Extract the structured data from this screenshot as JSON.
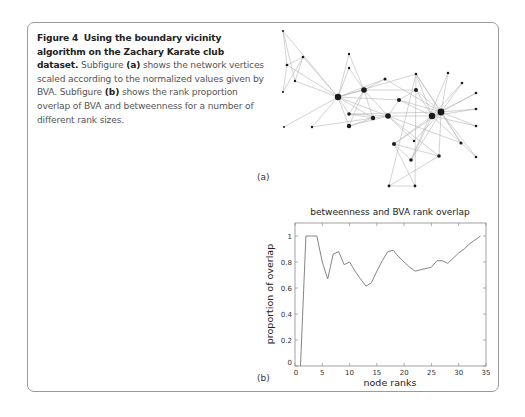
{
  "caption": {
    "figure_label": "Figure 4",
    "title": "Using the boundary vicinity algorithm on the Zachary Karate club dataset.",
    "text_1": "Subfigure",
    "ref_a": "(a)",
    "text_2": "shows the network vertices scaled according to the normalized values given by BVA. Subfigure",
    "ref_b": "(b)",
    "text_3": "shows the rank proportion overlap of BVA and betweenness for a number of different rank sizes."
  },
  "subfigure_a": {
    "label": "(a)",
    "network": {
      "nodes": [
        {
          "id": 0,
          "x": 338,
          "y": 97,
          "r": 3.2
        },
        {
          "id": 1,
          "x": 364,
          "y": 90,
          "r": 2.8
        },
        {
          "id": 2,
          "x": 388,
          "y": 116,
          "r": 2.8
        },
        {
          "id": 3,
          "x": 373,
          "y": 118,
          "r": 2.2
        },
        {
          "id": 4,
          "x": 283,
          "y": 31,
          "r": 1.1
        },
        {
          "id": 5,
          "x": 303,
          "y": 57,
          "r": 1.3
        },
        {
          "id": 6,
          "x": 287,
          "y": 65,
          "r": 1.3
        },
        {
          "id": 7,
          "x": 349,
          "y": 126,
          "r": 2.2
        },
        {
          "id": 8,
          "x": 399,
          "y": 100,
          "r": 2.0
        },
        {
          "id": 9,
          "x": 414,
          "y": 141,
          "r": 1.2
        },
        {
          "id": 10,
          "x": 295,
          "y": 81,
          "r": 1.2
        },
        {
          "id": 11,
          "x": 284,
          "y": 127,
          "r": 1.0
        },
        {
          "id": 12,
          "x": 312,
          "y": 127,
          "r": 1.2
        },
        {
          "id": 13,
          "x": 349,
          "y": 114,
          "r": 1.8
        },
        {
          "id": 14,
          "x": 476,
          "y": 126,
          "r": 1.3
        },
        {
          "id": 15,
          "x": 476,
          "y": 109,
          "r": 1.3
        },
        {
          "id": 16,
          "x": 283,
          "y": 92,
          "r": 1.1
        },
        {
          "id": 17,
          "x": 349,
          "y": 68,
          "r": 1.2
        },
        {
          "id": 18,
          "x": 476,
          "y": 93,
          "r": 1.3
        },
        {
          "id": 19,
          "x": 385,
          "y": 79,
          "r": 1.5
        },
        {
          "id": 20,
          "x": 476,
          "y": 157,
          "r": 1.3
        },
        {
          "id": 21,
          "x": 349,
          "y": 54,
          "r": 1.2
        },
        {
          "id": 22,
          "x": 462,
          "y": 83,
          "r": 1.3
        },
        {
          "id": 23,
          "x": 394,
          "y": 144,
          "r": 2.0
        },
        {
          "id": 24,
          "x": 389,
          "y": 186,
          "r": 1.4
        },
        {
          "id": 25,
          "x": 415,
          "y": 186,
          "r": 1.4
        },
        {
          "id": 26,
          "x": 448,
          "y": 73,
          "r": 1.3
        },
        {
          "id": 27,
          "x": 439,
          "y": 156,
          "r": 1.8
        },
        {
          "id": 28,
          "x": 461,
          "y": 143,
          "r": 1.6
        },
        {
          "id": 29,
          "x": 411,
          "y": 160,
          "r": 1.8
        },
        {
          "id": 30,
          "x": 416,
          "y": 90,
          "r": 2.0
        },
        {
          "id": 31,
          "x": 416,
          "y": 74,
          "r": 1.3
        },
        {
          "id": 32,
          "x": 432,
          "y": 116,
          "r": 3.2
        },
        {
          "id": 33,
          "x": 441,
          "y": 112,
          "r": 3.4
        }
      ],
      "edges": [
        [
          0,
          1
        ],
        [
          0,
          2
        ],
        [
          0,
          3
        ],
        [
          0,
          4
        ],
        [
          0,
          5
        ],
        [
          0,
          6
        ],
        [
          0,
          7
        ],
        [
          0,
          8
        ],
        [
          0,
          10
        ],
        [
          0,
          11
        ],
        [
          0,
          12
        ],
        [
          0,
          13
        ],
        [
          0,
          17
        ],
        [
          0,
          19
        ],
        [
          0,
          21
        ],
        [
          0,
          31
        ],
        [
          1,
          2
        ],
        [
          1,
          3
        ],
        [
          1,
          7
        ],
        [
          1,
          13
        ],
        [
          1,
          17
        ],
        [
          1,
          19
        ],
        [
          1,
          21
        ],
        [
          1,
          30
        ],
        [
          2,
          3
        ],
        [
          2,
          7
        ],
        [
          2,
          8
        ],
        [
          2,
          9
        ],
        [
          2,
          13
        ],
        [
          2,
          27
        ],
        [
          2,
          28
        ],
        [
          2,
          32
        ],
        [
          3,
          7
        ],
        [
          3,
          12
        ],
        [
          3,
          13
        ],
        [
          4,
          6
        ],
        [
          4,
          10
        ],
        [
          5,
          6
        ],
        [
          5,
          10
        ],
        [
          5,
          16
        ],
        [
          6,
          16
        ],
        [
          8,
          30
        ],
        [
          8,
          32
        ],
        [
          8,
          33
        ],
        [
          9,
          33
        ],
        [
          13,
          33
        ],
        [
          14,
          32
        ],
        [
          14,
          33
        ],
        [
          15,
          32
        ],
        [
          15,
          33
        ],
        [
          18,
          32
        ],
        [
          18,
          33
        ],
        [
          19,
          33
        ],
        [
          20,
          32
        ],
        [
          20,
          33
        ],
        [
          22,
          32
        ],
        [
          22,
          33
        ],
        [
          23,
          25
        ],
        [
          23,
          27
        ],
        [
          23,
          29
        ],
        [
          23,
          32
        ],
        [
          23,
          33
        ],
        [
          24,
          25
        ],
        [
          24,
          27
        ],
        [
          24,
          31
        ],
        [
          25,
          31
        ],
        [
          26,
          29
        ],
        [
          26,
          33
        ],
        [
          27,
          33
        ],
        [
          28,
          31
        ],
        [
          28,
          33
        ],
        [
          29,
          32
        ],
        [
          29,
          33
        ],
        [
          30,
          32
        ],
        [
          30,
          33
        ],
        [
          31,
          32
        ],
        [
          31,
          33
        ],
        [
          32,
          33
        ]
      ]
    }
  },
  "subfigure_b": {
    "label": "(b)"
  },
  "chart_data": {
    "type": "line",
    "title": "betweenness and BVA rank overlap",
    "xlabel": "node ranks",
    "ylabel": "proportion of overlap",
    "xlim": [
      0,
      35
    ],
    "ylim": [
      0,
      1.1
    ],
    "x_ticks": [
      0,
      5,
      10,
      15,
      20,
      25,
      30,
      35
    ],
    "y_ticks": [
      0,
      0.2,
      0.4,
      0.6,
      0.8,
      1
    ],
    "y_tick_labels": [
      "0",
      "0.2",
      "0.4",
      "0.6",
      "0.8",
      "1"
    ],
    "grid": false,
    "legend": null,
    "series": [
      {
        "name": "overlap",
        "x": [
          1,
          2,
          3,
          4,
          5,
          6,
          7,
          8,
          9,
          10,
          11,
          12,
          13,
          14,
          15,
          16,
          17,
          18,
          19,
          20,
          21,
          22,
          23,
          24,
          25,
          26,
          27,
          28,
          29,
          30,
          31,
          32,
          33,
          34
        ],
        "values": [
          0,
          1.0,
          1.0,
          1.0,
          0.8,
          0.67,
          0.86,
          0.88,
          0.78,
          0.8,
          0.73,
          0.67,
          0.615,
          0.64,
          0.73,
          0.81,
          0.88,
          0.89,
          0.84,
          0.8,
          0.76,
          0.73,
          0.74,
          0.75,
          0.76,
          0.81,
          0.81,
          0.79,
          0.83,
          0.87,
          0.9,
          0.94,
          0.97,
          1.0
        ],
        "color": "#777777"
      }
    ]
  }
}
